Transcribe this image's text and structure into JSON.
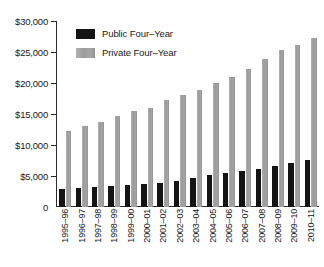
{
  "chart_data": {
    "type": "bar",
    "title": "",
    "subtitle": "",
    "xlabel": "",
    "ylabel": "",
    "ylim": [
      0,
      30000
    ],
    "grid": false,
    "legend_position": "top-left-inside",
    "y_ticks": [
      {
        "value": 30000,
        "label": "$30,000"
      },
      {
        "value": 25000,
        "label": "$25,000"
      },
      {
        "value": 20000,
        "label": "$20,000"
      },
      {
        "value": 15000,
        "label": "$15,000"
      },
      {
        "value": 10000,
        "label": "$10,000"
      },
      {
        "value": 5000,
        "label": "$5,000"
      },
      {
        "value": 0,
        "label": "0"
      }
    ],
    "categories": [
      "1995–96",
      "1996–97",
      "1997–98",
      "1998–99",
      "1999–00",
      "2000–01",
      "2001–02",
      "2002–03",
      "2003–04",
      "2004–05",
      "2005–06",
      "2006–07",
      "2007–08",
      "2008–09",
      "2009–10",
      "2010–11"
    ],
    "series": [
      {
        "name": "Public Four–Year",
        "color": "#141414",
        "values": [
          2900,
          3050,
          3200,
          3350,
          3500,
          3650,
          3900,
          4200,
          4700,
          5150,
          5550,
          5850,
          6200,
          6650,
          7100,
          7650
        ]
      },
      {
        "name": "Private Four–Year",
        "color": "#9a9a9a",
        "values": [
          12250,
          13000,
          13750,
          14700,
          15450,
          16050,
          17300,
          18050,
          18950,
          19950,
          21000,
          22300,
          23800,
          25300,
          26150,
          27300
        ]
      }
    ]
  },
  "legend": {
    "items": [
      {
        "label": "Public Four–Year",
        "swatch": "black-square-swatch"
      },
      {
        "label": "Private Four–Year",
        "swatch": "gray-square-swatch"
      }
    ]
  }
}
